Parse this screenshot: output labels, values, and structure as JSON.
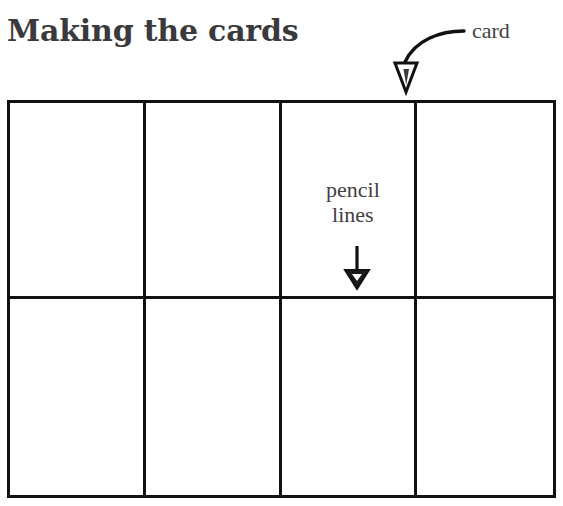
{
  "page": {
    "title": "Making the cards",
    "background_color": "#ffffff",
    "ink_color": "#111111",
    "text_color": "#3f3f42",
    "title_color": "#3a3a3c"
  },
  "diagram": {
    "grid": {
      "columns": 4,
      "rows": 2,
      "cells": [
        {
          "id": "card-1"
        },
        {
          "id": "card-2"
        },
        {
          "id": "card-3"
        },
        {
          "id": "card-4"
        },
        {
          "id": "card-5"
        },
        {
          "id": "card-6"
        },
        {
          "id": "card-7"
        },
        {
          "id": "card-8"
        }
      ]
    },
    "annotations": [
      {
        "id": "card",
        "label": "card",
        "arrow": "curved-arrow-down-left",
        "arrowhead": "hollow-triangle"
      },
      {
        "id": "pencil-lines",
        "label": "pencil\nlines",
        "arrow": "straight-arrow-down",
        "arrowhead": "solid-triangle"
      }
    ]
  }
}
